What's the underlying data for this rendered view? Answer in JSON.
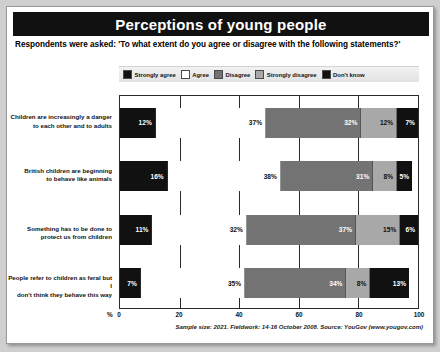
{
  "header": {
    "title": "Perceptions of young people",
    "subtitle": "Respondents were asked: 'To what extent do you agree or disagree with the following statements?'"
  },
  "footer": {
    "source": "Sample size: 2021. Fieldwork: 14-16 October 2008. Source: YouGov (www.yougov.com)"
  },
  "axis": {
    "unit_label": "%",
    "ticks": [
      "0",
      "20",
      "40",
      "60",
      "80",
      "100"
    ]
  },
  "legend": [
    {
      "label": "Strongly agree",
      "color": "#111111"
    },
    {
      "label": "Agree",
      "color": "#ffffff"
    },
    {
      "label": "Disagree",
      "color": "#737373"
    },
    {
      "label": "Strongly disagree",
      "color": "#a8a8a8"
    },
    {
      "label": "Don't know",
      "color": "#111111"
    }
  ],
  "chart_data": {
    "type": "bar",
    "title": "Perceptions of young people",
    "subtitle": "Respondents were asked: 'To what extent do you agree or disagree with the following statements?'",
    "orientation": "horizontal",
    "stacked": true,
    "stack_mode": "percent",
    "xlabel": "%",
    "ylabel": "",
    "xlim": [
      0,
      100
    ],
    "grid": true,
    "legend_position": "top",
    "categories": [
      "Children are increasingly a danger to each other and to adults",
      "British children are beginning to behave like animals",
      "Something has to be done to protect us from children",
      "People refer to children as feral but I don't think they behave this way"
    ],
    "series": [
      {
        "name": "Strongly agree",
        "color": "#111111",
        "values": [
          12,
          16,
          11,
          7
        ]
      },
      {
        "name": "Agree",
        "color": "#ffffff",
        "values": [
          37,
          38,
          32,
          35
        ]
      },
      {
        "name": "Disagree",
        "color": "#737373",
        "values": [
          32,
          31,
          37,
          34
        ]
      },
      {
        "name": "Strongly disagree",
        "color": "#a8a8a8",
        "values": [
          12,
          8,
          15,
          8
        ]
      },
      {
        "name": "Don't know",
        "color": "#111111",
        "values": [
          7,
          5,
          6,
          13
        ]
      }
    ],
    "value_labels": [
      [
        "12%",
        "37%",
        "32%",
        "12%",
        "7%"
      ],
      [
        "16%",
        "38%",
        "31%",
        "8%",
        "5%"
      ],
      [
        "11%",
        "32%",
        "37%",
        "15%",
        "6%"
      ],
      [
        "7%",
        "35%",
        "34%",
        "8%",
        "13%"
      ]
    ]
  },
  "category_lines": [
    [
      "Children are increasingly a danger",
      "to each other and to adults"
    ],
    [
      "British children are beginning",
      "to behave like animals"
    ],
    [
      "Something has to be done to protect us from children"
    ],
    [
      "People refer to children as feral but I",
      "don't think they behave this way"
    ]
  ]
}
